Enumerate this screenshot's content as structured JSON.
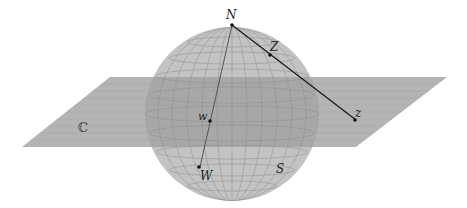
{
  "figure": {
    "labels": {
      "north_pole": "N",
      "sphere_point_Z": "Z",
      "plane_point_z": "z",
      "plane_point_w": "w",
      "sphere_point_W": "W",
      "sphere": "S",
      "complex_plane": "ℂ"
    },
    "colors": {
      "plane_fill": "#a9a9a9",
      "sphere_fill": "#b4b4b4",
      "grid_line": "#8a8a8a",
      "line": "#1a1a1a",
      "background": "#ffffff"
    }
  }
}
